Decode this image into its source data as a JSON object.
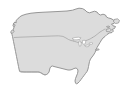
{
  "figure": {
    "kind": "map-figure",
    "projection_note": "conic",
    "width_px": 130,
    "height_px": 93
  },
  "colors": {
    "background": "#ffffff",
    "land_fill": "#dcdcdc",
    "coast_outline": "#8c8c8c",
    "internal_border": "#a0a0a0",
    "lake_fill": "#ffffff",
    "lake_outline": "#9a9a9a"
  },
  "layers": {
    "background_label": "ocean-background",
    "land_label": "north-america-landmass",
    "lakes_label": "great-lakes",
    "borders_label": "country-borders",
    "islands_label": "coastal-islands"
  },
  "regions": [
    {
      "id": "contiguous-united-states",
      "label": "United States"
    },
    {
      "id": "southern-canada",
      "label": "Canada"
    },
    {
      "id": "northern-mexico-border",
      "label": "Mexico border"
    }
  ],
  "features": [
    {
      "id": "great-lakes",
      "label": "Great Lakes"
    },
    {
      "id": "florida-peninsula",
      "label": "Florida peninsula"
    },
    {
      "id": "gulf-of-mexico-coast",
      "label": "Gulf Coast"
    },
    {
      "id": "pacific-northwest-coast",
      "label": "Pacific Northwest coast"
    },
    {
      "id": "gulf-of-st-lawrence",
      "label": "Gulf of St. Lawrence"
    },
    {
      "id": "hudson-bay-lowland",
      "label": "Hudson Bay approach"
    },
    {
      "id": "atlantic-seaboard",
      "label": "Atlantic seaboard"
    }
  ],
  "labels": {
    "visible_text": []
  }
}
